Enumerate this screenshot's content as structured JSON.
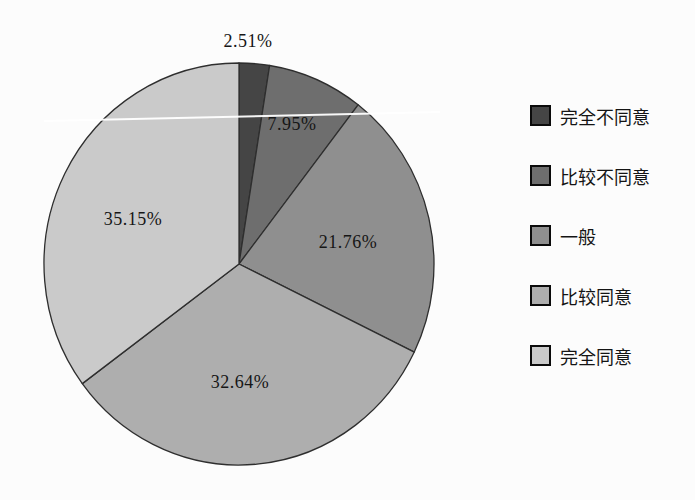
{
  "chart_data": {
    "type": "pie",
    "title": "",
    "start_angle": "top",
    "direction": "clockwise",
    "legend_position": "right",
    "stroke_color": "#2e2e2e",
    "background_color": "#fcfcfc",
    "slices": [
      {
        "label": "完全不同意",
        "value": 2.51,
        "display": "2.51%",
        "color": "#454545"
      },
      {
        "label": "比较不同意",
        "value": 7.95,
        "display": "7.95%",
        "color": "#6e6e6e"
      },
      {
        "label": "一般",
        "value": 21.76,
        "display": "21.76%",
        "color": "#8f8f8f"
      },
      {
        "label": "比较同意",
        "value": 32.64,
        "display": "32.64%",
        "color": "#aeaeae"
      },
      {
        "label": "完全同意",
        "value": 35.15,
        "display": "35.15%",
        "color": "#cacaca"
      }
    ]
  }
}
